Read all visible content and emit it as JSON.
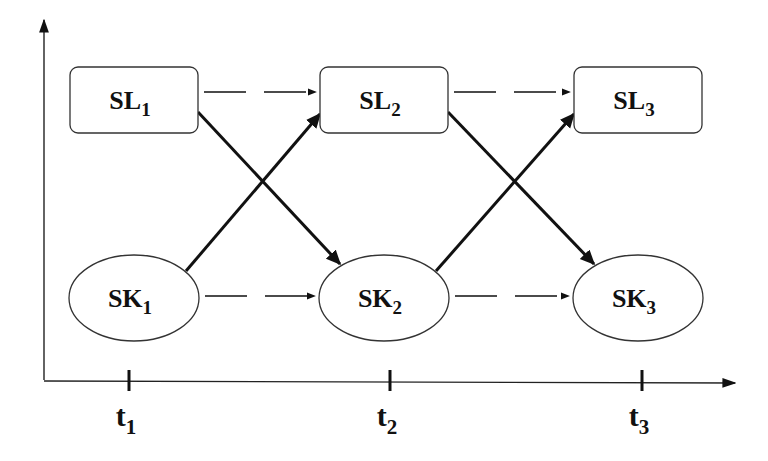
{
  "diagram": {
    "nodes": [
      {
        "id": "SL1",
        "base": "SL",
        "sub": "1",
        "shape": "rounded-rect",
        "row": "top",
        "col": 1
      },
      {
        "id": "SL2",
        "base": "SL",
        "sub": "2",
        "shape": "rounded-rect",
        "row": "top",
        "col": 2
      },
      {
        "id": "SL3",
        "base": "SL",
        "sub": "3",
        "shape": "rounded-rect",
        "row": "top",
        "col": 3
      },
      {
        "id": "SK1",
        "base": "SK",
        "sub": "1",
        "shape": "ellipse",
        "row": "bottom",
        "col": 1
      },
      {
        "id": "SK2",
        "base": "SK",
        "sub": "2",
        "shape": "ellipse",
        "row": "bottom",
        "col": 2
      },
      {
        "id": "SK3",
        "base": "SK",
        "sub": "3",
        "shape": "ellipse",
        "row": "bottom",
        "col": 3
      }
    ],
    "edges": [
      {
        "from": "SL1",
        "to": "SL2",
        "style": "dashed"
      },
      {
        "from": "SL2",
        "to": "SL3",
        "style": "dashed"
      },
      {
        "from": "SK1",
        "to": "SK2",
        "style": "dashed"
      },
      {
        "from": "SK2",
        "to": "SK3",
        "style": "dashed"
      },
      {
        "from": "SL1",
        "to": "SK2",
        "style": "solid-bold"
      },
      {
        "from": "SK1",
        "to": "SL2",
        "style": "solid-bold"
      },
      {
        "from": "SL2",
        "to": "SK3",
        "style": "solid-bold"
      },
      {
        "from": "SK2",
        "to": "SL3",
        "style": "solid-bold"
      }
    ],
    "time_axis": {
      "ticks": [
        {
          "base": "t",
          "sub": "1"
        },
        {
          "base": "t",
          "sub": "2"
        },
        {
          "base": "t",
          "sub": "3"
        }
      ]
    },
    "colors": {
      "stroke": "#111111",
      "background": "#ffffff"
    }
  }
}
